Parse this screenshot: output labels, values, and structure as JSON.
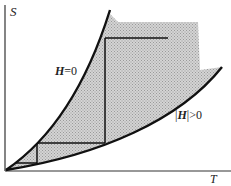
{
  "diagram": {
    "axes": {
      "y_label": "S",
      "x_label": "T"
    },
    "curves": [
      {
        "name": "zero-field",
        "label_bold": "H",
        "label_rest": "=0"
      },
      {
        "name": "nonzero-field",
        "label_prefix": "|",
        "label_bold": "H",
        "label_rest": "|>0"
      }
    ],
    "colors": {
      "line": "#111111",
      "shade": "#c8c8c8",
      "background": "#ffffff"
    }
  }
}
